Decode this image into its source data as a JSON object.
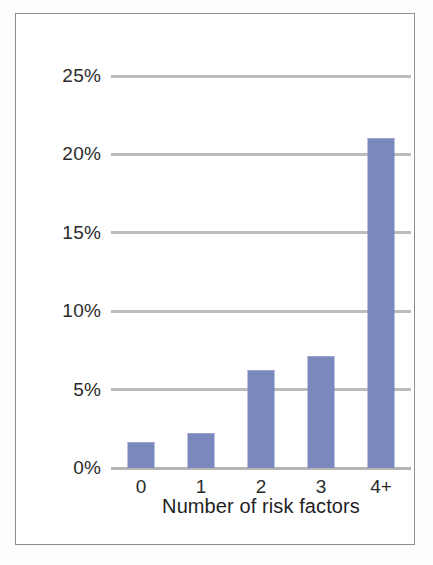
{
  "figure": {
    "background_color": "#ffffff",
    "frame_color": "#8f8f8f"
  },
  "chart_data": {
    "type": "bar",
    "title": "",
    "subtitle": "",
    "xlabel": "Number of risk factors",
    "ylabel": "",
    "categories": [
      "0",
      "1",
      "2",
      "3",
      "4+"
    ],
    "values": [
      1.6,
      2.2,
      6.2,
      7.1,
      21.0
    ],
    "value_unit": "%",
    "ylim": [
      0,
      25
    ],
    "ytick_values": [
      0,
      5,
      10,
      15,
      20,
      25
    ],
    "ytick_labels": [
      "0%",
      "5%",
      "10%",
      "15%",
      "20%",
      "25%"
    ],
    "grid": true,
    "grid_axis": "y",
    "grid_color": "#b0b0b0",
    "legend": false,
    "legend_position": "none",
    "series": [
      {
        "name": "Prevalence",
        "color": "#7b88bd",
        "values": [
          1.6,
          2.2,
          6.2,
          7.1,
          21.0
        ]
      }
    ],
    "annotations": []
  }
}
